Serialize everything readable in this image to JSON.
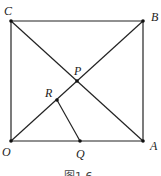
{
  "figure": {
    "caption": "图1.6",
    "points": {
      "O": {
        "label": "O",
        "x": 11,
        "y": 141
      },
      "A": {
        "label": "A",
        "x": 143,
        "y": 141
      },
      "B": {
        "label": "B",
        "x": 143,
        "y": 21
      },
      "C": {
        "label": "C",
        "x": 11,
        "y": 21
      },
      "P": {
        "label": "P",
        "x": 77,
        "y": 81
      },
      "R": {
        "label": "R",
        "x": 57,
        "y": 100
      },
      "Q": {
        "label": "Q",
        "x": 80,
        "y": 141
      }
    },
    "segments": [
      "OA",
      "AB",
      "BC",
      "CO",
      "OB",
      "CA",
      "RQ"
    ],
    "colors": {
      "line": "#222222",
      "background": "#ffffff"
    }
  }
}
